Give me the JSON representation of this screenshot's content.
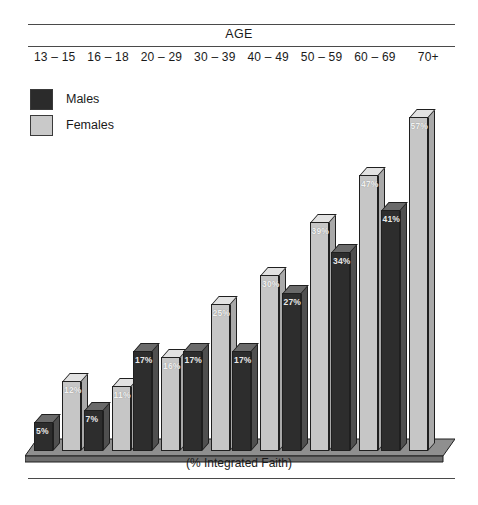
{
  "header": {
    "axis_title": "AGE"
  },
  "legend": {
    "items": [
      {
        "label": "Males",
        "color": "#2d2d2d",
        "key": "males"
      },
      {
        "label": "Females",
        "color": "#c6c6c6",
        "key": "females"
      }
    ]
  },
  "caption": "(% Integrated Faith)",
  "chart_data": {
    "type": "bar",
    "title": "AGE",
    "xlabel": "AGE",
    "ylabel": "(% Integrated Faith)",
    "categories": [
      "13 – 15",
      "16 – 18",
      "20 – 29",
      "30 – 39",
      "40 – 49",
      "50 – 59",
      "60 – 69",
      "70+"
    ],
    "series": [
      {
        "name": "Males",
        "color": "#2d2d2d",
        "values": [
          5,
          7,
          17,
          17,
          17,
          27,
          34,
          41
        ],
        "labels": [
          "5%",
          "7%",
          "17%",
          "17%",
          "17%",
          "27%",
          "34%",
          "41%"
        ]
      },
      {
        "name": "Females",
        "color": "#c6c6c6",
        "values": [
          12,
          11,
          16,
          25,
          30,
          39,
          47,
          57
        ],
        "labels": [
          "12%",
          "11%",
          "16%",
          "25%",
          "30%",
          "39%",
          "47%",
          "57%"
        ]
      }
    ],
    "ylim": [
      0,
      60
    ],
    "grid": false,
    "legend_position": "top-left",
    "value_labels": true,
    "style": "3d-column"
  }
}
